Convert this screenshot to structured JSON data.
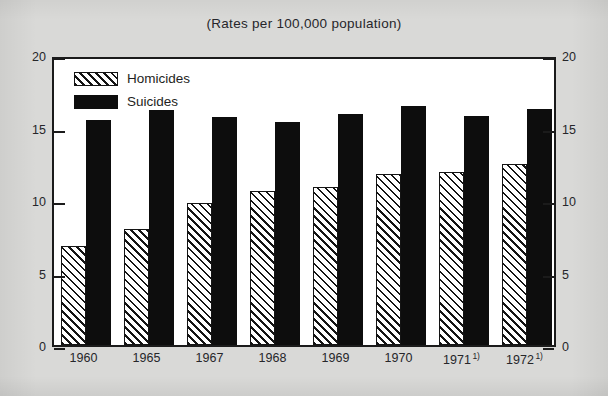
{
  "chart_data": {
    "type": "bar",
    "title": "(Rates per 100,000 population)",
    "xlabel": "",
    "ylabel": "",
    "ylim": [
      0,
      20
    ],
    "yticks": [
      0,
      5,
      10,
      15,
      20
    ],
    "grid": false,
    "legend_position": "top-left",
    "dual_y_axis": true,
    "categories": [
      "1960",
      "1965",
      "1967",
      "1968",
      "1969",
      "1970",
      "1971",
      "1972"
    ],
    "category_labels": [
      "1960",
      "1965",
      "1967",
      "1968",
      "1969",
      "1970",
      "1971",
      "1972"
    ],
    "category_footnotes": [
      "",
      "",
      "",
      "",
      "",
      "",
      "1)",
      "1)"
    ],
    "series": [
      {
        "name": "Homicides",
        "fill": "hatched",
        "values": [
          6.8,
          8.0,
          9.8,
          10.6,
          10.9,
          11.8,
          11.9,
          12.5
        ]
      },
      {
        "name": "Suicides",
        "fill": "solid",
        "values": [
          15.5,
          16.2,
          15.7,
          15.4,
          15.9,
          16.5,
          15.8,
          16.3
        ]
      }
    ]
  },
  "legend": {
    "items": [
      {
        "label": "Homicides",
        "style": "hatched"
      },
      {
        "label": "Suicides",
        "style": "solid"
      }
    ]
  },
  "axis": {
    "left_ticks": [
      "20",
      "15",
      "10",
      "5",
      "0"
    ],
    "right_ticks": [
      "20",
      "15",
      "10",
      "5",
      "0"
    ]
  },
  "colors": {
    "page_background": "#d9d9d7",
    "plot_background": "#ffffff",
    "ink": "#1b1b1b",
    "suicides_fill": "#0d0d0d",
    "homicides_fill": "#ffffff"
  }
}
